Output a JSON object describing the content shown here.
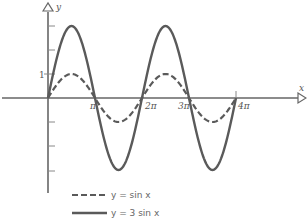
{
  "chart_data": {
    "type": "line",
    "title": "",
    "xlabel": "x",
    "ylabel": "y",
    "x_ticks": [
      "π",
      "2π",
      "3π",
      "4π"
    ],
    "y_tick_labels": [
      "1"
    ],
    "xlim": [
      0,
      12.566
    ],
    "ylim": [
      -4,
      4
    ],
    "grid": false,
    "legend_position": "bottom-left",
    "series": [
      {
        "name": "y = sin x",
        "style": "dashed",
        "amplitude": 1,
        "function": "sin x"
      },
      {
        "name": "y = 3 sin x",
        "style": "solid",
        "amplitude": 3,
        "function": "3 sin x"
      }
    ]
  },
  "axes": {
    "x_label": "x",
    "y_label": "y",
    "ticks": {
      "pi": "π",
      "two_pi": "2π",
      "three_pi": "3π",
      "four_pi": "4π"
    },
    "y_one": "1"
  },
  "legend": {
    "dashed": "y = sin x",
    "solid": "y = 3 sin x"
  },
  "colors": {
    "curve": "#5a5a5a",
    "axis": "#666666",
    "text": "#555555"
  }
}
